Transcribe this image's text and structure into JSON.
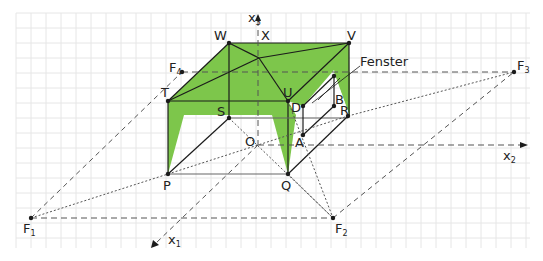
{
  "diagram": {
    "grid": {
      "x0": 16,
      "y0": 13,
      "x1": 530,
      "y1": 248,
      "step": 15,
      "color": "#e3e3e3"
    },
    "colors": {
      "fill": "#7dc64b",
      "line": "#1b1b1b",
      "dashed": "#555555"
    },
    "axes": {
      "x1": {
        "label": "x",
        "sub": "1"
      },
      "x2": {
        "label": "x",
        "sub": "2"
      },
      "x3": {
        "label": "x",
        "sub": "3"
      }
    },
    "points": {
      "W": "W",
      "X": "X",
      "V": "V",
      "T": "T",
      "S": "S",
      "U": "U",
      "D": "D",
      "B": "B",
      "R": "R",
      "A": "A",
      "O": "O",
      "P": "P",
      "Q": "Q",
      "C": "C"
    },
    "vanishing_points": {
      "F1": {
        "label": "F",
        "sub": "1"
      },
      "F2": {
        "label": "F",
        "sub": "2"
      },
      "F3": {
        "label": "F",
        "sub": "3"
      },
      "F4": {
        "label": "F",
        "sub": "4"
      }
    },
    "annotation": {
      "fenster": "Fenster"
    }
  }
}
